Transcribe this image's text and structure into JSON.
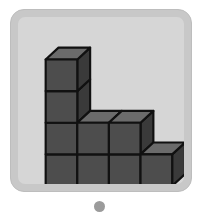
{
  "card": {
    "frame_color": "#c8c8c8",
    "inner_background": "#d6d6d6",
    "border_color": "#bdbdbd"
  },
  "figure": {
    "cube_face_size": 32,
    "depth_offset_x": 13,
    "depth_offset_y": -12,
    "origin_x": 28,
    "origin_y": 171,
    "column_heights": [
      4,
      2,
      2,
      1
    ],
    "total_visible_cubes": 9,
    "colors": {
      "top_face": "#6b6b6b",
      "front_face": "#4d4d4d",
      "side_face": "#3a3a3a",
      "outline": "#111111"
    },
    "outline_width": 2.2
  },
  "pagination": {
    "dot_color": "#9b9b9b",
    "dot_count": 1,
    "active_index": 0
  }
}
